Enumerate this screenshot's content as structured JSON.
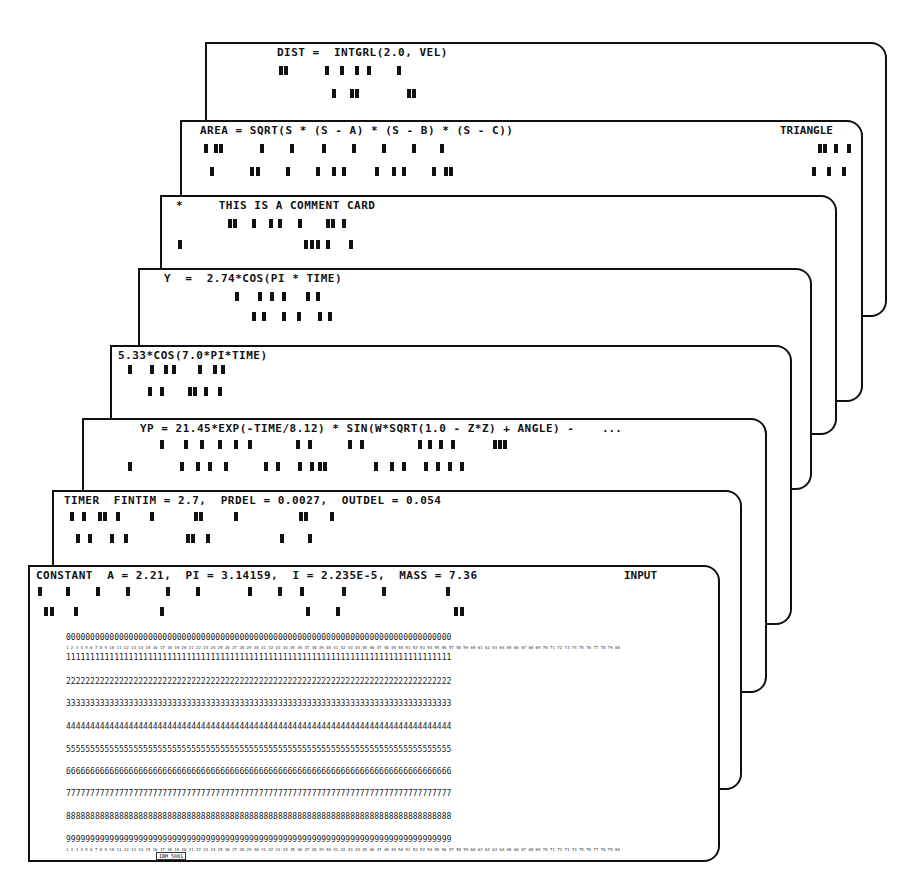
{
  "figure": {
    "cards": [
      {
        "id": "dist",
        "statement": "DIST =  INTGRL(2.0, VEL)",
        "right_label": ""
      },
      {
        "id": "area",
        "statement": "AREA = SQRT(S * (S - A) * (S - B) * (S - C))",
        "right_label": "TRIANGLE"
      },
      {
        "id": "comment",
        "statement": "*     THIS IS A COMMENT CARD",
        "right_label": ""
      },
      {
        "id": "y",
        "statement": "Y  =  2.74*COS(PI * TIME)",
        "right_label": ""
      },
      {
        "id": "cos",
        "statement": "5.33*COS(7.0*PI*TIME)",
        "right_label": ""
      },
      {
        "id": "yp",
        "statement": "YP = 21.45*EXP(-TIME/8.12) * SIN(W*SQRT(1.0 - Z*Z) + ANGLE) -",
        "right_label": "..."
      },
      {
        "id": "timer",
        "statement": "TIMER  FINTIM = 2.7,  PRDEL = 0.0027,  OUTDEL = 0.054",
        "right_label": ""
      },
      {
        "id": "constant",
        "statement": "CONSTANT  A = 2.21,  PI = 3.14159,  I = 2.235E-5,  MASS = 7.36",
        "right_label": "INPUT"
      }
    ],
    "digit_rows": {
      "r0": "00000000000000000000000000000000000000000000000000000000000000000000000000000000",
      "r1": "11111111111111111111111111111111111111111111111111111111111111111111111111111111",
      "r2": "22222222222222222222222222222222222222222222222222222222222222222222222222222222",
      "r3": "33333333333333333333333333333333333333333333333333333333333333333333333333333333",
      "r4": "44444444444444444444444444444444444444444444444444444444444444444444444444444444",
      "r5": "55555555555555555555555555555555555555555555555555555555555555555555555555555555",
      "r6": "66666666666666666666666666666666666666666666666666666666666666666666666666666666",
      "r7": "77777777777777777777777777777777777777777777777777777777777777777777777777777777",
      "r8": "88888888888888888888888888888888888888888888888888888888888888888888888888888888",
      "r9": "99999999999999999999999999999999999999999999999999999999999999999999999999999999"
    },
    "column_numbers": "1 2 3 4 5 6 7 8 9 10 11 12 13 14 15 16 17 18 19 20 21 22 23 24 25 26 27 28 29 30 31 32 33 34 35 36 37 38 39 40 41 42 43 44 45 46 47 48 49 50 51 52 53 54 55 56 57 58 59 60 61 62 63 64 65 66 67 68 69 70 71 72 73 74 75 76 77 78 79 80",
    "edge_labels": [
      "1",
      "2",
      "3",
      "4",
      "5",
      "6",
      "7",
      "8",
      "9"
    ],
    "card_stock_label": "IBM 5081"
  }
}
